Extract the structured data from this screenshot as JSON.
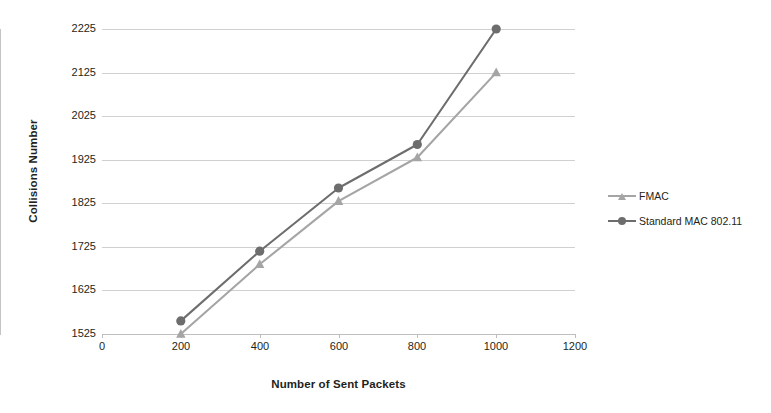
{
  "chart_data": {
    "type": "line",
    "title": "",
    "xlabel": "Number of Sent Packets",
    "ylabel": "Collisions Number",
    "x": [
      200,
      400,
      600,
      800,
      1000
    ],
    "xticks": [
      "0",
      "200",
      "400",
      "600",
      "800",
      "1000",
      "1200"
    ],
    "xlim": [
      0,
      1200
    ],
    "yticks": [
      "1525",
      "1625",
      "1725",
      "1825",
      "1925",
      "2025",
      "2125",
      "2225"
    ],
    "ylim": [
      1525,
      2225
    ],
    "grid": "horizontal",
    "legend_position": "right",
    "series": [
      {
        "name": "FMAC",
        "marker": "triangle",
        "color": "#a5a5a5",
        "values": [
          1525,
          1685,
          1830,
          1930,
          2125
        ]
      },
      {
        "name": "Standard MAC 802.11",
        "marker": "circle",
        "color": "#6d6d6d",
        "values": [
          1555,
          1715,
          1860,
          1960,
          2225
        ]
      }
    ]
  },
  "colors": {
    "series_fmac": "#a5a5a5",
    "series_standard": "#6d6d6d",
    "gridline": "#d0d0d0",
    "axis": "#c4c4c4",
    "text": "#231f20"
  }
}
